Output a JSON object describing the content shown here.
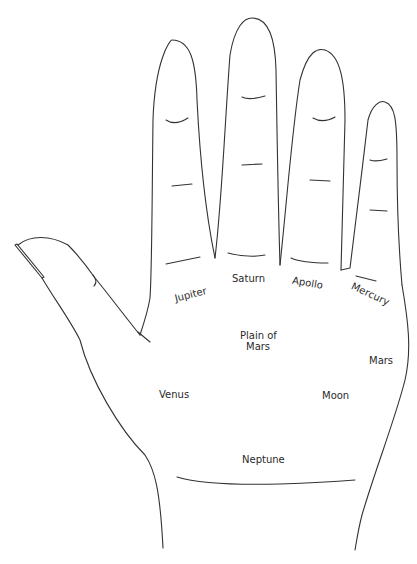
{
  "diagram": {
    "type": "palmistry hand map",
    "regions": [
      {
        "id": "jupiter",
        "label": "Jupiter"
      },
      {
        "id": "saturn",
        "label": "Saturn"
      },
      {
        "id": "apollo",
        "label": "Apollo"
      },
      {
        "id": "mercury",
        "label": "Mercury"
      },
      {
        "id": "plain_of_mars",
        "label_line1": "Plain of",
        "label_line2": "Mars"
      },
      {
        "id": "mars",
        "label": "Mars"
      },
      {
        "id": "venus",
        "label": "Venus"
      },
      {
        "id": "moon",
        "label": "Moon"
      },
      {
        "id": "neptune",
        "label": "Neptune"
      }
    ],
    "stroke_color": "#333333",
    "background": "#ffffff"
  }
}
